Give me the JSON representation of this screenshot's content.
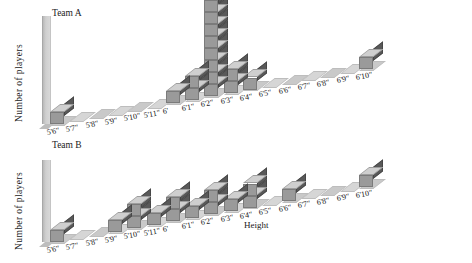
{
  "chart_data": [
    {
      "type": "bar",
      "title": "Team A",
      "xlabel": "",
      "ylabel": "Number of players",
      "categories": [
        "5'6\"",
        "5'7\"",
        "5'8\"",
        "5'9\"",
        "5'10\"",
        "5'11\"",
        "6'",
        "6'1\"",
        "6'2\"",
        "6'3\"",
        "6'4\"",
        "6'5\"",
        "6'6\"",
        "6'7\"",
        "6'8\"",
        "6'9\"",
        "6'10\""
      ],
      "values": [
        1,
        0,
        0,
        0,
        0,
        0,
        1,
        2,
        8,
        2,
        1,
        0,
        0,
        0,
        0,
        0,
        1
      ],
      "ylim": [
        0,
        8
      ],
      "grid": false,
      "legend": "none",
      "style": "isometric-3d-cube-stacks"
    },
    {
      "type": "bar",
      "title": "Team B",
      "xlabel": "Height",
      "ylabel": "Number of players",
      "categories": [
        "5'6\"",
        "5'7\"",
        "5'8\"",
        "5'9\"",
        "5'10\"",
        "5'11\"",
        "6'",
        "6'1\"",
        "6'2\"",
        "6'3\"",
        "6'4\"",
        "6'5\"",
        "6'6\"",
        "6'7\"",
        "6'8\"",
        "6'9\"",
        "6'10\""
      ],
      "values": [
        1,
        0,
        0,
        1,
        2,
        1,
        2,
        1,
        2,
        1,
        2,
        0,
        1,
        0,
        0,
        0,
        1
      ],
      "ylim": [
        0,
        8
      ],
      "grid": false,
      "legend": "none",
      "style": "isometric-3d-cube-stacks"
    }
  ],
  "charts": [
    {
      "id": "A",
      "title": "Team A",
      "ylabel": "Number of players",
      "xlabel": ""
    },
    {
      "id": "B",
      "title": "Team B",
      "ylabel": "Number of players",
      "xlabel": "Height"
    }
  ],
  "colors": {
    "cube_top": "#cfcfcf",
    "cube_left": "#9a9a9a",
    "cube_right": "#595959",
    "floor": "#c9c9c9",
    "axis": "#c4c4c4",
    "text": "#1a1a1a",
    "background": "#ffffff"
  }
}
